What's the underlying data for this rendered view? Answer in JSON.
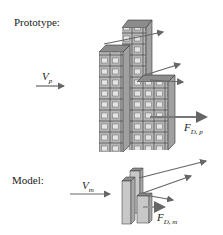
{
  "prototype": {
    "label": "Prototype:",
    "velocity": {
      "symbol": "V",
      "subscript": "p"
    },
    "force": {
      "symbol": "F",
      "subscript": "D, p"
    }
  },
  "model": {
    "label": "Model:",
    "velocity": {
      "symbol": "V",
      "subscript": "m"
    },
    "force": {
      "symbol": "F",
      "subscript": "D, m"
    }
  },
  "colors": {
    "building_face": "#c8c8c8",
    "building_side": "#a8a8a8",
    "building_top": "#8c8c8c",
    "window": "#e4e4e4",
    "arrow": "#666666"
  }
}
